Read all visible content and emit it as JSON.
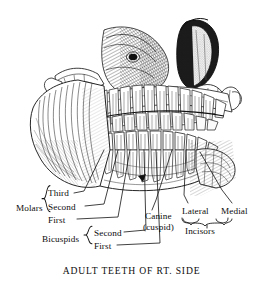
{
  "figure": {
    "caption": "ADULT TEETH OF RT. SIDE",
    "illustration_name": "engraved-skull-right-side-teeth",
    "ink_color": "#1a1a1a",
    "background_color": "#ffffff"
  },
  "groups": {
    "molars": {
      "label": "Molars",
      "items": [
        {
          "label": "Third"
        },
        {
          "label": "Second"
        },
        {
          "label": "First"
        }
      ]
    },
    "bicuspids": {
      "label": "Bicuspids",
      "items": [
        {
          "label": "Second"
        },
        {
          "label": "First"
        }
      ]
    },
    "incisors": {
      "label": "Incisors",
      "items": [
        {
          "label": "Lateral"
        },
        {
          "label": "Medial"
        }
      ]
    }
  },
  "canine": {
    "label": "Canine",
    "sublabel": "(cuspid)"
  }
}
